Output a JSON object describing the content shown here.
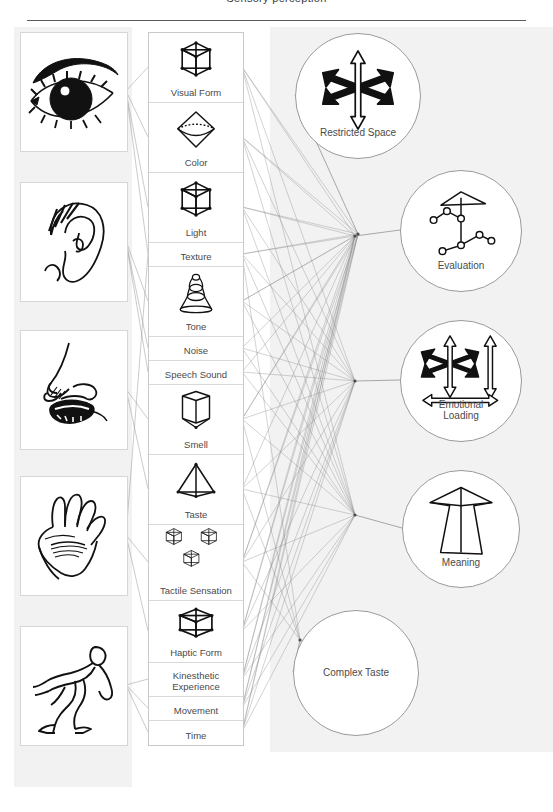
{
  "title": "Sensory perception",
  "colors": {
    "panel_bg": "#f2f2f2",
    "page_bg": "#ffffff",
    "text": "#4a4a4a",
    "edge": "#8a8a8a",
    "rule": "#5b5b5b",
    "circle_stroke": "#9a9a9a"
  },
  "senses": {
    "label": "sense organs",
    "items": [
      {
        "name": "eye",
        "icon": "eye-illustration"
      },
      {
        "name": "ear",
        "icon": "ear-illustration"
      },
      {
        "name": "nose-mouth",
        "icon": "nose-mouth-illustration"
      },
      {
        "name": "hand",
        "icon": "hand-palm-illustration"
      },
      {
        "name": "body",
        "icon": "running-body-illustration"
      }
    ]
  },
  "modalities": {
    "label": "perceptual qualities",
    "items": [
      {
        "label": "Visual Form",
        "icon": "wire-cube-icon",
        "has_icon": true,
        "height": 70
      },
      {
        "label": "Color",
        "icon": "octahedron-icon",
        "has_icon": true,
        "height": 70
      },
      {
        "label": "Light",
        "icon": "wire-cube-icon",
        "has_icon": true,
        "height": 70
      },
      {
        "label": "Texture",
        "icon": "",
        "has_icon": false,
        "height": 24
      },
      {
        "label": "Tone",
        "icon": "bell-icon",
        "has_icon": true,
        "height": 70
      },
      {
        "label": "Noise",
        "icon": "",
        "has_icon": false,
        "height": 24
      },
      {
        "label": "Speech Sound",
        "icon": "",
        "has_icon": false,
        "height": 24
      },
      {
        "label": "Smell",
        "icon": "open-prism-icon",
        "has_icon": true,
        "height": 70
      },
      {
        "label": "Taste",
        "icon": "pyramid-icon",
        "has_icon": true,
        "height": 70
      },
      {
        "label": "Tactile Sensation",
        "icon": "three-cubes-icon",
        "has_icon": true,
        "height": 76
      },
      {
        "label": "Haptic Form",
        "icon": "flat-cube-icon",
        "has_icon": true,
        "height": 62
      },
      {
        "label": "Kinesthetic\nExperience",
        "icon": "",
        "has_icon": false,
        "height": 34
      },
      {
        "label": "Movement",
        "icon": "",
        "has_icon": false,
        "height": 24
      },
      {
        "label": "Time",
        "icon": "",
        "has_icon": false,
        "height": 24
      }
    ]
  },
  "concepts": {
    "label": "higher order percepts",
    "items": [
      {
        "label": "Restricted Space",
        "icon": "six-arrow-star-icon",
        "has_icon": true,
        "cx": 357,
        "cy": 95,
        "r": 62,
        "label_center": false
      },
      {
        "label": "Evaluation",
        "icon": "node-network-icon",
        "has_icon": true,
        "cx": 460,
        "cy": 230,
        "r": 60,
        "label_center": false
      },
      {
        "label": "Emotional\nLoading",
        "icon": "arrows-with-rulers-icon",
        "has_icon": true,
        "cx": 460,
        "cy": 380,
        "r": 60,
        "label_center": false
      },
      {
        "label": "Meaning",
        "icon": "big-arrow-icon",
        "has_icon": true,
        "cx": 460,
        "cy": 528,
        "r": 58,
        "label_center": false
      },
      {
        "label": "Complex Taste",
        "icon": "",
        "has_icon": false,
        "cx": 355,
        "cy": 672,
        "r": 62,
        "label_center": true
      }
    ]
  },
  "graph": {
    "hubs": [
      {
        "name": "hub-restricted-space",
        "x": 358,
        "y": 234
      },
      {
        "name": "hub-evaluation",
        "x": 355,
        "y": 236
      },
      {
        "name": "hub-emotional-loading",
        "x": 355,
        "y": 381
      },
      {
        "name": "hub-meaning",
        "x": 355,
        "y": 515
      },
      {
        "name": "hub-complex-taste",
        "x": 300,
        "y": 640
      }
    ],
    "organ_to_modality": [
      [
        0,
        0
      ],
      [
        0,
        1
      ],
      [
        0,
        2
      ],
      [
        0,
        3
      ],
      [
        1,
        4
      ],
      [
        1,
        5
      ],
      [
        1,
        6
      ],
      [
        2,
        7
      ],
      [
        2,
        8
      ],
      [
        3,
        9
      ],
      [
        3,
        10
      ],
      [
        3,
        3
      ],
      [
        4,
        11
      ],
      [
        4,
        12
      ],
      [
        4,
        13
      ]
    ],
    "modality_to_hub": [
      [
        0,
        0
      ],
      [
        1,
        0
      ],
      [
        2,
        0
      ],
      [
        3,
        0
      ],
      [
        4,
        0
      ],
      [
        7,
        0
      ],
      [
        9,
        0
      ],
      [
        10,
        0
      ],
      [
        11,
        0
      ],
      [
        12,
        0
      ],
      [
        13,
        0
      ],
      [
        0,
        1
      ],
      [
        1,
        1
      ],
      [
        2,
        1
      ],
      [
        3,
        1
      ],
      [
        4,
        1
      ],
      [
        5,
        1
      ],
      [
        6,
        1
      ],
      [
        7,
        1
      ],
      [
        8,
        1
      ],
      [
        9,
        1
      ],
      [
        10,
        1
      ],
      [
        11,
        1
      ],
      [
        12,
        1
      ],
      [
        13,
        1
      ],
      [
        0,
        2
      ],
      [
        1,
        2
      ],
      [
        2,
        2
      ],
      [
        3,
        2
      ],
      [
        4,
        2
      ],
      [
        5,
        2
      ],
      [
        6,
        2
      ],
      [
        7,
        2
      ],
      [
        8,
        2
      ],
      [
        9,
        2
      ],
      [
        10,
        2
      ],
      [
        11,
        2
      ],
      [
        12,
        2
      ],
      [
        13,
        2
      ],
      [
        0,
        3
      ],
      [
        1,
        3
      ],
      [
        2,
        3
      ],
      [
        3,
        3
      ],
      [
        4,
        3
      ],
      [
        5,
        3
      ],
      [
        6,
        3
      ],
      [
        7,
        3
      ],
      [
        8,
        3
      ],
      [
        9,
        3
      ],
      [
        10,
        3
      ],
      [
        11,
        3
      ],
      [
        12,
        3
      ],
      [
        13,
        3
      ],
      [
        7,
        4
      ],
      [
        8,
        4
      ],
      [
        9,
        4
      ],
      [
        3,
        4
      ]
    ]
  }
}
